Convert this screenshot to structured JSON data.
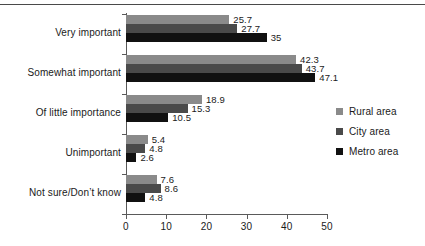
{
  "chart_data": {
    "type": "bar",
    "orientation": "horizontal",
    "title": "",
    "xlabel": "",
    "ylabel": "",
    "xlim": [
      0,
      50
    ],
    "xticks": [
      0,
      10,
      20,
      30,
      40,
      50
    ],
    "xtick_labels": [
      "0",
      "10",
      "20",
      "30",
      "40",
      "50"
    ],
    "grid": false,
    "legend_position": "right",
    "categories": [
      "Very important",
      "Somewhat important",
      "Of little importance",
      "Unimportant",
      "Not sure/Don’t know"
    ],
    "series": [
      {
        "name": "Rural area",
        "color": "#8a8a8a",
        "values": [
          25.7,
          42.3,
          18.9,
          5.4,
          7.6
        ],
        "labels": [
          "25.7",
          "42.3",
          "18.9",
          "5.4",
          "7.6"
        ]
      },
      {
        "name": "City area",
        "color": "#4a4a4a",
        "values": [
          27.7,
          43.7,
          15.3,
          4.8,
          8.6
        ],
        "labels": [
          "27.7",
          "43.7",
          "15.3",
          "4.8",
          "8.6"
        ]
      },
      {
        "name": "Metro area",
        "color": "#111111",
        "values": [
          35,
          47.1,
          10.5,
          2.6,
          4.8
        ],
        "labels": [
          "35",
          "47.1",
          "10.5",
          "2.6",
          "4.8"
        ]
      }
    ]
  }
}
